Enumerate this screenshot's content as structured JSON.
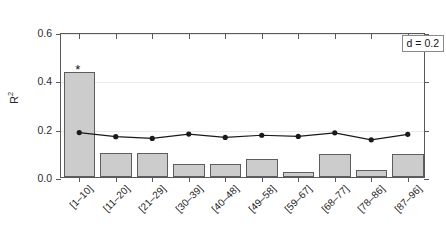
{
  "chart_data": {
    "type": "bar",
    "title": "",
    "subtitle": "",
    "xlabel": "",
    "ylabel": "R²",
    "ylim": [
      0.0,
      0.6
    ],
    "yticks": [
      "0.0",
      "0.2",
      "0.4",
      "0.6"
    ],
    "ytick_values": [
      0.0,
      0.2,
      0.4,
      0.6
    ],
    "grid": "horizontal",
    "legend": "none",
    "categories": [
      "[1–10]",
      "[11–20]",
      "[21–29]",
      "[30–39]",
      "[40–48]",
      "[49–58]",
      "[59–67]",
      "[68–77]",
      "[78–86]",
      "[87–96]"
    ],
    "series": [
      {
        "name": "R² bars",
        "type": "bar",
        "values": [
          0.435,
          0.1,
          0.1,
          0.055,
          0.055,
          0.075,
          0.02,
          0.095,
          0.03,
          0.095
        ],
        "color": "#cccccc",
        "edge_color": "#5d5d5d"
      },
      {
        "name": "reference line",
        "type": "line",
        "values": [
          0.192,
          0.175,
          0.168,
          0.186,
          0.172,
          0.181,
          0.176,
          0.191,
          0.162,
          0.185
        ],
        "color": "#1a1a1a",
        "marker": "filled-circle"
      }
    ],
    "annotations": [
      {
        "name": "significance-star",
        "text": "*",
        "category": "[1–10]",
        "y": 0.47
      },
      {
        "name": "parameter-label",
        "text": "d = 0.2",
        "position": "top-right",
        "boxed": true
      }
    ]
  },
  "axes": {
    "y_title_main": "R",
    "y_title_sup": "2",
    "annotation_text": "d = 0.2",
    "star_text": "*"
  }
}
